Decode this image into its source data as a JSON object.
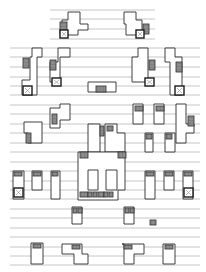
{
  "diagram": {
    "title": "",
    "type": "floor-plan-schematic",
    "colors": {
      "background": "#ffffff",
      "rule": "#b8b8b8",
      "wall": "#2a2a2a",
      "stair": "#9a9a9a"
    },
    "rules": {
      "top_group": {
        "x1": 50,
        "x2": 155,
        "ys": [
          10,
          19,
          29,
          39
        ]
      },
      "main_group": {
        "x1": 10,
        "x2": 200,
        "ys": [
          48,
          57,
          67,
          77,
          86,
          95,
          105,
          114,
          124,
          133,
          143,
          152,
          162,
          171,
          181,
          190,
          199,
          209,
          218,
          228,
          237,
          247,
          256,
          265
        ]
      }
    },
    "walls": [
      [
        68,
        12,
        80,
        12,
        80,
        24,
        88,
        24,
        88,
        30,
        78,
        30,
        78,
        35,
        62,
        35,
        62,
        20,
        68,
        20,
        68,
        12
      ],
      [
        124,
        12,
        136,
        12,
        136,
        20,
        142,
        20,
        142,
        35,
        126,
        35,
        126,
        24,
        124,
        24,
        124,
        12
      ],
      [
        32,
        48,
        42,
        48,
        42,
        57,
        37,
        57,
        37,
        95,
        22,
        95,
        22,
        80,
        30,
        80,
        30,
        57,
        32,
        57,
        32,
        48
      ],
      [
        60,
        48,
        70,
        48,
        70,
        57,
        60,
        57,
        60,
        82,
        50,
        82,
        50,
        62,
        58,
        62,
        58,
        48,
        60,
        48
      ],
      [
        138,
        48,
        148,
        48,
        148,
        82,
        132,
        82,
        132,
        57,
        138,
        57,
        138,
        48
      ],
      [
        165,
        48,
        175,
        48,
        175,
        57,
        182,
        57,
        182,
        95,
        170,
        95,
        170,
        62,
        165,
        62,
        165,
        48
      ],
      [
        88,
        82,
        116,
        82,
        116,
        92,
        88,
        92,
        88,
        82
      ],
      [
        60,
        104,
        70,
        104,
        70,
        120,
        60,
        120,
        60,
        128,
        50,
        128,
        50,
        108,
        60,
        108,
        60,
        104
      ],
      [
        40,
        122,
        42,
        122,
        42,
        143,
        28,
        143,
        28,
        133,
        24,
        133,
        24,
        122,
        40,
        122
      ],
      [
        133,
        104,
        143,
        104,
        143,
        124,
        133,
        124,
        133,
        104
      ],
      [
        154,
        104,
        164,
        104,
        164,
        124,
        154,
        124,
        154,
        104
      ],
      [
        176,
        104,
        186,
        104,
        186,
        124,
        194,
        124,
        194,
        133,
        186,
        133,
        186,
        143,
        176,
        143,
        176,
        104
      ],
      [
        145,
        133,
        153,
        133,
        153,
        152,
        145,
        152,
        145,
        133
      ],
      [
        165,
        133,
        175,
        133,
        175,
        152,
        165,
        152,
        165,
        133
      ],
      [
        88,
        124,
        100,
        124,
        100,
        152,
        88,
        152,
        88,
        124
      ],
      [
        105,
        124,
        117,
        124,
        117,
        133,
        125,
        133,
        125,
        152,
        105,
        152,
        105,
        124
      ],
      [
        78,
        152,
        125,
        152,
        125,
        190,
        118,
        190,
        118,
        200,
        78,
        200,
        78,
        152
      ],
      [
        13,
        171,
        24,
        171,
        24,
        199,
        13,
        199,
        13,
        171
      ],
      [
        32,
        171,
        42,
        171,
        42,
        190,
        32,
        190,
        32,
        171
      ],
      [
        51,
        171,
        60,
        171,
        60,
        199,
        51,
        199,
        51,
        171
      ],
      [
        88,
        170,
        98,
        170,
        98,
        190,
        88,
        190,
        88,
        170
      ],
      [
        106,
        170,
        117,
        170,
        117,
        190,
        106,
        190,
        106,
        170
      ],
      [
        145,
        171,
        155,
        171,
        155,
        199,
        145,
        199,
        145,
        171
      ],
      [
        164,
        171,
        174,
        171,
        174,
        190,
        164,
        190,
        164,
        171
      ],
      [
        183,
        171,
        193,
        171,
        193,
        199,
        183,
        199,
        183,
        171
      ],
      [
        72,
        207,
        82,
        207,
        82,
        224,
        72,
        224,
        72,
        207
      ],
      [
        124,
        207,
        134,
        207,
        134,
        224,
        124,
        224,
        124,
        207
      ],
      [
        31,
        243,
        43,
        243,
        43,
        264,
        31,
        264,
        31,
        243
      ],
      [
        62,
        244,
        82,
        244,
        82,
        254,
        88,
        254,
        88,
        264,
        74,
        264,
        74,
        254,
        62,
        254,
        62,
        244
      ],
      [
        122,
        244,
        144,
        244,
        144,
        254,
        134,
        254,
        134,
        264,
        124,
        264,
        124,
        244,
        122,
        244
      ],
      [
        163,
        244,
        175,
        244,
        175,
        264,
        163,
        264,
        163,
        244
      ]
    ],
    "stairs": [
      [
        60,
        22,
        7,
        12
      ],
      [
        143,
        24,
        6,
        10
      ],
      [
        23,
        58,
        6,
        10
      ],
      [
        50,
        60,
        6,
        10
      ],
      [
        149,
        60,
        6,
        10
      ],
      [
        176,
        62,
        6,
        10
      ],
      [
        96,
        86,
        10,
        6
      ],
      [
        52,
        114,
        5,
        10
      ],
      [
        26,
        133,
        5,
        10
      ],
      [
        135,
        106,
        8,
        5
      ],
      [
        156,
        106,
        8,
        5
      ],
      [
        188,
        116,
        6,
        10
      ],
      [
        146,
        134,
        6,
        5
      ],
      [
        166,
        134,
        6,
        5
      ],
      [
        80,
        152,
        8,
        6
      ],
      [
        118,
        152,
        8,
        6
      ],
      [
        100,
        126,
        4,
        10
      ],
      [
        107,
        126,
        6,
        5
      ],
      [
        80,
        192,
        8,
        5
      ],
      [
        88,
        192,
        4,
        5
      ],
      [
        93,
        192,
        4,
        5
      ],
      [
        98,
        192,
        6,
        5
      ],
      [
        104,
        192,
        4,
        5
      ],
      [
        109,
        192,
        4,
        5
      ],
      [
        14,
        172,
        8,
        4
      ],
      [
        33,
        172,
        8,
        4
      ],
      [
        52,
        172,
        6,
        4
      ],
      [
        146,
        172,
        8,
        4
      ],
      [
        165,
        172,
        8,
        4
      ],
      [
        184,
        172,
        8,
        4
      ],
      [
        73,
        208,
        4,
        5
      ],
      [
        78,
        208,
        4,
        5
      ],
      [
        125,
        208,
        4,
        5
      ],
      [
        130,
        208,
        4,
        5
      ],
      [
        150,
        220,
        6,
        5
      ],
      [
        33,
        244,
        8,
        4
      ],
      [
        72,
        245,
        8,
        4
      ],
      [
        124,
        245,
        8,
        4
      ],
      [
        165,
        245,
        8,
        4
      ]
    ],
    "xboxes": [
      [
        60,
        30,
        8,
        8
      ],
      [
        136,
        30,
        8,
        8
      ],
      [
        23,
        86,
        9,
        9
      ],
      [
        52,
        78,
        9,
        8
      ],
      [
        145,
        78,
        9,
        8
      ],
      [
        175,
        86,
        9,
        9
      ],
      [
        14,
        188,
        9,
        9
      ],
      [
        184,
        188,
        9,
        9
      ]
    ]
  }
}
